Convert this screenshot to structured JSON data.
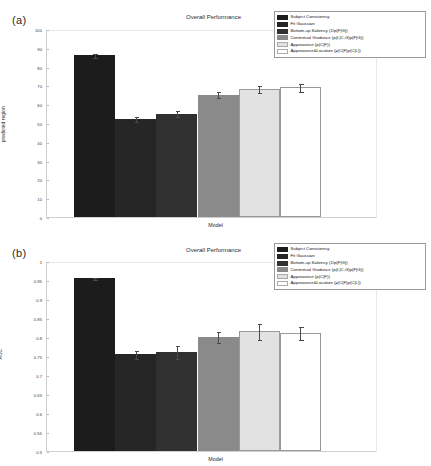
{
  "figure": {
    "panels": [
      {
        "tag": "(a)",
        "title": "Overall Performance",
        "xlabel": "Model",
        "ylabel_line1": "% fixation within",
        "ylabel_line2": "predicted region",
        "yticks": [
          "100",
          "90",
          "80",
          "70",
          "60",
          "50",
          "40",
          "30",
          "20",
          "10",
          "0"
        ]
      },
      {
        "tag": "(b)",
        "title": "Overall Performance",
        "xlabel": "Model",
        "ylabel_line1": "AUC",
        "ylabel_line2": "",
        "yticks": [
          "1",
          "0.95",
          "0.9",
          "0.85",
          "0.8",
          "0.75",
          "0.7",
          "0.65",
          "0.6",
          "0.55",
          "0.5"
        ]
      }
    ],
    "legend_entries": [
      {
        "label": "Subject Consistency",
        "color": "#1c1c1c"
      },
      {
        "label": "Fit Gaussian",
        "color": "#262626"
      },
      {
        "label": "Bottom-up Saliency (1/p(F|G))",
        "color": "#303030"
      },
      {
        "label": "Contextual Guidance (p(L|C,G)p(F|G))",
        "color": "#8a8a8a"
      },
      {
        "label": "Appearance (p(C|F))",
        "color": "#e2e2e2"
      },
      {
        "label": "Appearance&Location (p(C|F)p(C|L))",
        "color": "#ffffff"
      }
    ]
  },
  "chart_data": [
    {
      "type": "bar",
      "panel": "(a)",
      "title": "Overall Performance",
      "xlabel": "Model",
      "ylabel": "% fixation within predicted region",
      "ylim": [
        0,
        100
      ],
      "ytick_values": [
        0,
        10,
        20,
        30,
        40,
        50,
        60,
        70,
        80,
        90,
        100
      ],
      "grid": false,
      "legend_position": "top-right",
      "categories": [
        "Subject Consistency",
        "Fit Gaussian",
        "Bottom-up Saliency (1/p(F|G))",
        "Contextual Guidance (p(L|C,G)p(F|G))",
        "Appearance (p(C|F))",
        "Appearance&Location (p(C|F)p(C|L))"
      ],
      "values": [
        86,
        52,
        55,
        65,
        68,
        69
      ],
      "errors": [
        1.2,
        1.5,
        2.0,
        1.8,
        2.2,
        2.5
      ],
      "colors": [
        "#1c1c1c",
        "#262626",
        "#303030",
        "#8a8a8a",
        "#e2e2e2",
        "#ffffff"
      ]
    },
    {
      "type": "bar",
      "panel": "(b)",
      "title": "Overall Performance",
      "xlabel": "Model",
      "ylabel": "AUC",
      "ylim": [
        0.5,
        1.0
      ],
      "ytick_values": [
        0.5,
        0.55,
        0.6,
        0.65,
        0.7,
        0.75,
        0.8,
        0.85,
        0.9,
        0.95,
        1.0
      ],
      "grid": false,
      "legend_position": "top-right",
      "categories": [
        "Subject Consistency",
        "Fit Gaussian",
        "Bottom-up Saliency (1/p(F|G))",
        "Contextual Guidance (p(L|C,G)p(F|G))",
        "Appearance (p(C|F))",
        "Appearance&Location (p(C|F)p(C|L))"
      ],
      "values": [
        0.955,
        0.755,
        0.76,
        0.8,
        0.815,
        0.81
      ],
      "errors": [
        0.004,
        0.012,
        0.018,
        0.016,
        0.022,
        0.018
      ],
      "colors": [
        "#1c1c1c",
        "#262626",
        "#303030",
        "#8a8a8a",
        "#e2e2e2",
        "#ffffff"
      ]
    }
  ]
}
